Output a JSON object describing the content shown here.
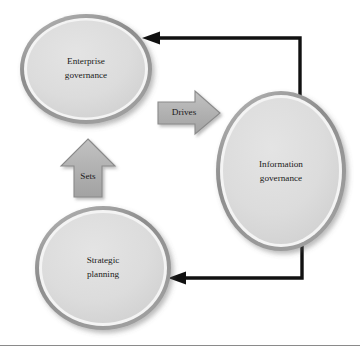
{
  "figure": {
    "kind": "cycle-diagram",
    "background_color": "#ffffff",
    "footer_rule_color": "#8a8a8a"
  },
  "nodes": [
    {
      "id": "enterprise-governance",
      "label_line1": "Enterprise",
      "label_line2": "governance",
      "shape": "ellipse",
      "fill_color": "#d9d9d9",
      "rim_color": "#8f8f8f",
      "cx": 86,
      "cy": 69,
      "rx": 66,
      "ry": 55
    },
    {
      "id": "information-governance",
      "label_line1": "Information",
      "label_line2": "governance",
      "shape": "ellipse",
      "fill_color": "#d9d9d9",
      "rim_color": "#8f8f8f",
      "cx": 281,
      "cy": 171,
      "rx": 65,
      "ry": 80
    },
    {
      "id": "strategic-planning",
      "label_line1": "Strategic",
      "label_line2": "planning",
      "shape": "ellipse",
      "fill_color": "#d9d9d9",
      "rim_color": "#8f8f8f",
      "cx": 103,
      "cy": 268,
      "rx": 68,
      "ry": 62
    }
  ],
  "block_arrows": [
    {
      "id": "drives-arrow",
      "label": "Drives",
      "direction": "right",
      "fill_color": "#b3b3b3",
      "stroke_color": "#8a8a8a",
      "label_x": 186,
      "label_y": 113
    },
    {
      "id": "sets-arrow",
      "label": "Sets",
      "direction": "up",
      "fill_color": "#b3b3b3",
      "stroke_color": "#8a8a8a",
      "label_x": 88,
      "label_y": 176
    }
  ],
  "connectors": [
    {
      "id": "information-to-enterprise",
      "from": "information-governance",
      "to": "enterprise-governance",
      "color": "#111111",
      "style": "elbow-with-arrowhead",
      "direction": "leftward-at-top"
    },
    {
      "id": "information-to-strategic",
      "from": "information-governance",
      "to": "strategic-planning",
      "color": "#111111",
      "style": "elbow-with-arrowhead",
      "direction": "leftward-at-bottom"
    }
  ]
}
